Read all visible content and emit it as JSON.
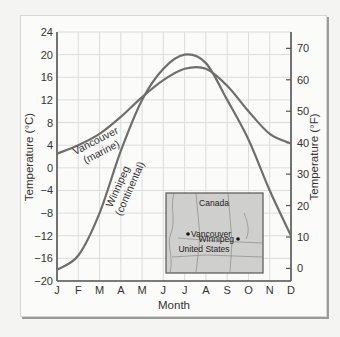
{
  "chart_data": {
    "type": "line",
    "title": "",
    "xlabel": "Month",
    "ylabel": "Temperature (°C)",
    "ylabel_right": "Temperature (°F)",
    "categories": [
      "J",
      "F",
      "M",
      "A",
      "M",
      "J",
      "J",
      "A",
      "S",
      "O",
      "N",
      "D"
    ],
    "ylim": [
      -20,
      24
    ],
    "yticks": [
      24,
      20,
      16,
      12,
      8,
      4,
      0,
      -4,
      -8,
      -12,
      -16,
      -20
    ],
    "yticks_right": [
      70,
      60,
      50,
      40,
      30,
      20,
      10,
      0
    ],
    "grid": true,
    "series": [
      {
        "name": "Vancouver (marine)",
        "label_line1": "Vancouver",
        "label_line2": "(marine)",
        "values": [
          2.5,
          4,
          6,
          9,
          12.5,
          15.5,
          17.5,
          17.5,
          14.5,
          10,
          6,
          4.3
        ]
      },
      {
        "name": "Winnipeg (continental)",
        "label_line1": "Winnipeg",
        "label_line2": "(continental)",
        "values": [
          -18,
          -15.5,
          -8,
          3,
          12,
          17.5,
          20,
          18.5,
          12,
          5,
          -4,
          -12
        ]
      }
    ],
    "inset_map": {
      "country_north": "Canada",
      "country_south": "United States",
      "cities": [
        "Vancouver",
        "Winnipeg"
      ]
    }
  },
  "colors": {
    "curve": "#6e6e6e",
    "axis": "#555555",
    "grid": "#dcdcdc",
    "map_fill": "#cfcfcd"
  }
}
